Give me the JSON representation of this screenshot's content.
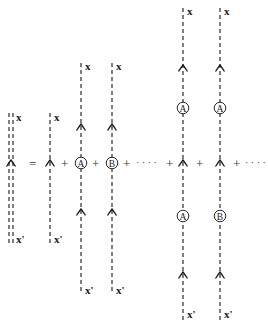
{
  "diagram": {
    "lhs": {
      "type": "double-dashed-propagator",
      "top_label": "x",
      "bottom_label": "x'"
    },
    "equals": "=",
    "terms": [
      {
        "id": "bare",
        "top_label": "x",
        "bottom_label": "x'",
        "insertions": []
      },
      {
        "id": "single-A",
        "top_label": "x",
        "bottom_label": "x'",
        "insertions": [
          "A"
        ]
      },
      {
        "id": "single-B",
        "top_label": "x",
        "bottom_label": "x'",
        "insertions": [
          "B"
        ]
      },
      {
        "id": "double-AA",
        "top_label": "x",
        "bottom_label": "x'",
        "insertions": [
          "A",
          "A"
        ]
      },
      {
        "id": "double-AB",
        "top_label": "x",
        "bottom_label": "x'",
        "insertions": [
          "A",
          "B"
        ]
      }
    ],
    "operators": {
      "plus": "+",
      "ellipsis": "· · · ·"
    },
    "labels": {
      "x": "x",
      "xp": "x'",
      "A": "A",
      "B": "B"
    },
    "colors": {
      "line": "#2a2a2a",
      "background": "#ffffff"
    }
  }
}
